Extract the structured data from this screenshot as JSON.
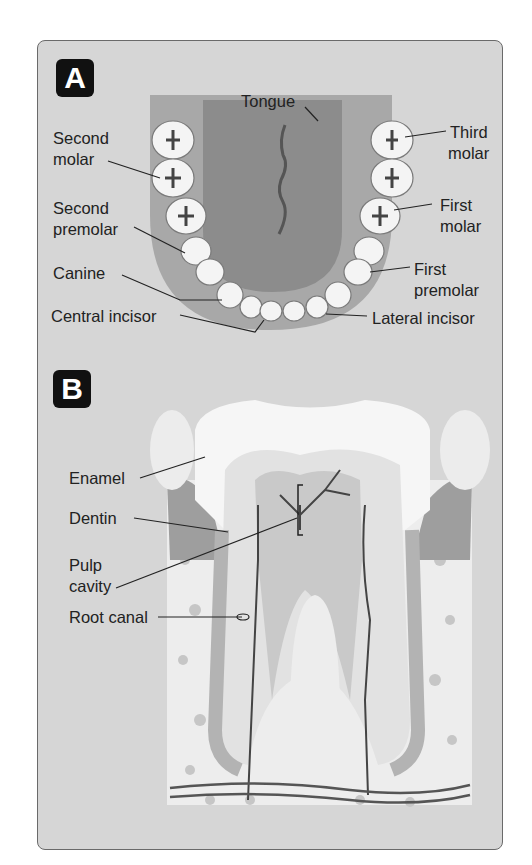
{
  "figure": {
    "panels": [
      {
        "badge": "A",
        "title": "Lower jaw teeth (occlusal view)",
        "labels": {
          "tongue": "Tongue",
          "second_molar_l1": "Second",
          "second_molar_l2": "molar",
          "second_premolar_l1": "Second",
          "second_premolar_l2": "premolar",
          "canine": "Canine",
          "central_incisor": "Central incisor",
          "third_molar_l1": "Third",
          "third_molar_l2": "molar",
          "first_molar_l1": "First",
          "first_molar_l2": "molar",
          "first_premolar_l1": "First",
          "first_premolar_l2": "premolar",
          "lateral_incisor": "Lateral incisor"
        }
      },
      {
        "badge": "B",
        "title": "Tooth cross-section",
        "labels": {
          "enamel": "Enamel",
          "dentin": "Dentin",
          "pulp_l1": "Pulp",
          "pulp_l2": "cavity",
          "root_canal": "Root canal"
        }
      }
    ]
  },
  "colors": {
    "panel_bg": "#d6d6d6",
    "badge_bg": "#111111",
    "tooth": "#f4f4f4",
    "gum": "#9a9a9a",
    "tongue": "#8c8c8c",
    "bone_spot": "#c4c4c4",
    "label_text": "#222222"
  }
}
